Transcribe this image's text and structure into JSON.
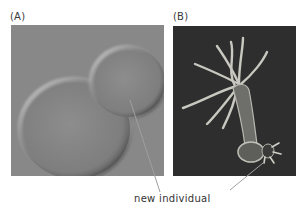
{
  "panels": [
    {
      "label": "(A)",
      "subject": "budding yeast cells (DIC micrograph)",
      "background": "#8a8a8a"
    },
    {
      "label": "(B)",
      "subject": "hydra with bud",
      "background": "#2f2f2f"
    }
  ],
  "annotation": {
    "text": "new individual",
    "line_color": "#9a9a9a"
  }
}
